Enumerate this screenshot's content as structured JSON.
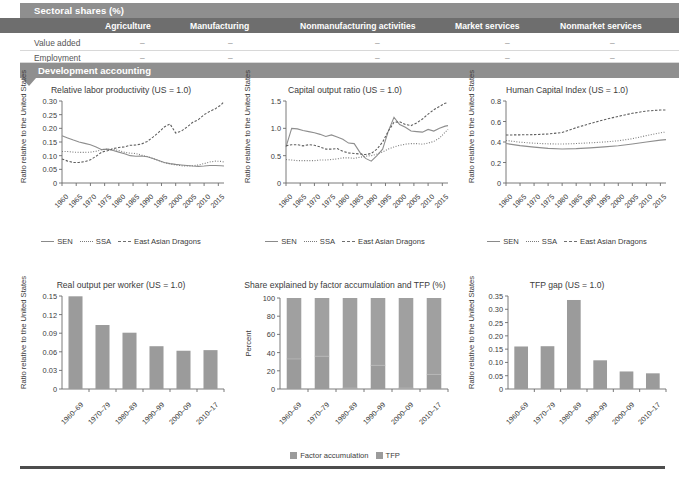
{
  "table": {
    "section_title": "Sectoral shares (%)",
    "columns": [
      "Agriculture",
      "Manufacturing",
      "Nonmanufacturing activities",
      "Market services",
      "Nonmarket services"
    ],
    "rows": [
      {
        "label": "Value added",
        "values": [
          "–",
          "–",
          "–",
          "–",
          "–"
        ]
      },
      {
        "label": "Employment",
        "values": [
          "–",
          "–",
          "–",
          "–",
          "–"
        ]
      }
    ],
    "dev_title": "Development accounting"
  },
  "line_legend": [
    {
      "name": "SEN",
      "style": "solid"
    },
    {
      "name": "SSA",
      "style": "dotted"
    },
    {
      "name": "East Asian Dragons",
      "style": "dashed"
    }
  ],
  "bar_legend": [
    {
      "name": "Factor accumulation",
      "color": "#9b9b9b"
    },
    {
      "name": "TFP",
      "color": "#9b9b9b"
    }
  ],
  "chart_data": [
    {
      "id": "relative-labor-productivity",
      "type": "line",
      "title": "Relative labor productivity (US = 1.0)",
      "xlabel": "",
      "ylabel": "Ratio relative to the United States",
      "ylim": [
        0,
        0.3
      ],
      "yticks": [
        0,
        0.05,
        0.1,
        0.15,
        0.2,
        0.25,
        0.3
      ],
      "ytick_labels": [
        "0",
        "0.05",
        "0.10",
        "0.15",
        "0.20",
        "0.25",
        "0.30"
      ],
      "xlim": [
        1960,
        2017
      ],
      "xticks": [
        1960,
        1965,
        1970,
        1975,
        1980,
        1985,
        1990,
        1995,
        2000,
        2005,
        2010,
        2015
      ],
      "xtick_labels": [
        "1960",
        "1965",
        "1970",
        "1975",
        "1980",
        "1985",
        "1990",
        "1995",
        "2000",
        "2005",
        "2010",
        "2015"
      ],
      "grid": false,
      "legend_position": "bottom",
      "series": [
        {
          "name": "SEN",
          "style": "solid",
          "x": [
            1960,
            1962,
            1964,
            1966,
            1968,
            1970,
            1972,
            1974,
            1976,
            1978,
            1980,
            1982,
            1984,
            1986,
            1988,
            1990,
            1992,
            1994,
            1996,
            1998,
            2000,
            2002,
            2004,
            2006,
            2008,
            2010,
            2012,
            2014,
            2016,
            2017
          ],
          "values": [
            0.173,
            0.165,
            0.157,
            0.15,
            0.145,
            0.14,
            0.132,
            0.122,
            0.124,
            0.119,
            0.113,
            0.107,
            0.1,
            0.098,
            0.099,
            0.096,
            0.09,
            0.082,
            0.075,
            0.071,
            0.068,
            0.066,
            0.064,
            0.062,
            0.061,
            0.062,
            0.064,
            0.064,
            0.063,
            0.062
          ]
        },
        {
          "name": "SSA",
          "style": "dotted",
          "x": [
            1960,
            1962,
            1964,
            1966,
            1968,
            1970,
            1972,
            1974,
            1976,
            1978,
            1980,
            1982,
            1984,
            1986,
            1988,
            1990,
            1992,
            1994,
            1996,
            1998,
            2000,
            2002,
            2004,
            2006,
            2008,
            2010,
            2012,
            2014,
            2016,
            2017
          ],
          "values": [
            0.115,
            0.115,
            0.113,
            0.112,
            0.112,
            0.113,
            0.116,
            0.122,
            0.124,
            0.123,
            0.119,
            0.112,
            0.109,
            0.108,
            0.102,
            0.097,
            0.09,
            0.082,
            0.074,
            0.07,
            0.066,
            0.063,
            0.062,
            0.063,
            0.066,
            0.071,
            0.077,
            0.08,
            0.079,
            0.077
          ]
        },
        {
          "name": "East Asian Dragons",
          "style": "dashed",
          "x": [
            1960,
            1962,
            1964,
            1966,
            1968,
            1970,
            1972,
            1974,
            1976,
            1978,
            1980,
            1982,
            1984,
            1986,
            1988,
            1990,
            1992,
            1994,
            1996,
            1998,
            2000,
            2002,
            2004,
            2006,
            2008,
            2010,
            2012,
            2014,
            2016,
            2017
          ],
          "values": [
            0.088,
            0.08,
            0.075,
            0.075,
            0.078,
            0.085,
            0.098,
            0.113,
            0.118,
            0.126,
            0.13,
            0.132,
            0.138,
            0.139,
            0.143,
            0.152,
            0.168,
            0.185,
            0.205,
            0.216,
            0.183,
            0.19,
            0.205,
            0.222,
            0.232,
            0.25,
            0.262,
            0.272,
            0.286,
            0.298
          ]
        }
      ]
    },
    {
      "id": "capital-output-ratio",
      "type": "line",
      "title": "Capital output ratio (US = 1.0)",
      "xlabel": "",
      "ylabel": "Ratio relative to the United States",
      "ylim": [
        0,
        1.5
      ],
      "yticks": [
        0,
        0.5,
        1.0,
        1.5
      ],
      "ytick_labels": [
        "0",
        "0.5",
        "1.0",
        "1.5"
      ],
      "xlim": [
        1960,
        2017
      ],
      "xticks": [
        1960,
        1965,
        1970,
        1975,
        1980,
        1985,
        1990,
        1995,
        2000,
        2005,
        2010,
        2015
      ],
      "xtick_labels": [
        "1960",
        "1965",
        "1970",
        "1975",
        "1980",
        "1985",
        "1990",
        "1995",
        "2000",
        "2005",
        "2010",
        "2015"
      ],
      "grid": false,
      "legend_position": "bottom",
      "series": [
        {
          "name": "SEN",
          "style": "solid",
          "x": [
            1960,
            1962,
            1964,
            1966,
            1968,
            1970,
            1972,
            1974,
            1976,
            1978,
            1980,
            1982,
            1984,
            1986,
            1988,
            1990,
            1992,
            1994,
            1996,
            1998,
            2000,
            2002,
            2004,
            2006,
            2008,
            2010,
            2012,
            2014,
            2016,
            2017
          ],
          "values": [
            0.66,
            1.0,
            0.99,
            0.96,
            0.94,
            0.92,
            0.89,
            0.85,
            0.88,
            0.84,
            0.8,
            0.73,
            0.72,
            0.56,
            0.45,
            0.4,
            0.5,
            0.62,
            0.95,
            1.2,
            1.07,
            1.02,
            0.95,
            0.94,
            0.93,
            0.98,
            0.95,
            1.0,
            1.04,
            1.05
          ]
        },
        {
          "name": "SSA",
          "style": "dotted",
          "x": [
            1960,
            1962,
            1964,
            1966,
            1968,
            1970,
            1972,
            1974,
            1976,
            1978,
            1980,
            1982,
            1984,
            1986,
            1988,
            1990,
            1992,
            1994,
            1996,
            1998,
            2000,
            2002,
            2004,
            2006,
            2008,
            2010,
            2012,
            2014,
            2016,
            2017
          ],
          "values": [
            0.43,
            0.42,
            0.41,
            0.41,
            0.41,
            0.41,
            0.42,
            0.42,
            0.43,
            0.44,
            0.46,
            0.46,
            0.45,
            0.47,
            0.49,
            0.5,
            0.53,
            0.57,
            0.62,
            0.66,
            0.69,
            0.71,
            0.72,
            0.72,
            0.71,
            0.73,
            0.76,
            0.82,
            0.93,
            0.98
          ]
        },
        {
          "name": "East Asian Dragons",
          "style": "dashed",
          "x": [
            1960,
            1962,
            1964,
            1966,
            1968,
            1970,
            1972,
            1974,
            1976,
            1978,
            1980,
            1982,
            1984,
            1986,
            1988,
            1990,
            1992,
            1994,
            1996,
            1998,
            2000,
            2002,
            2004,
            2006,
            2008,
            2010,
            2012,
            2014,
            2016,
            2017
          ],
          "values": [
            0.68,
            0.7,
            0.7,
            0.68,
            0.7,
            0.69,
            0.66,
            0.62,
            0.62,
            0.63,
            0.58,
            0.55,
            0.54,
            0.53,
            0.52,
            0.54,
            0.62,
            0.75,
            0.95,
            1.11,
            1.12,
            1.07,
            1.05,
            1.1,
            1.17,
            1.26,
            1.34,
            1.4,
            1.46,
            1.47
          ]
        }
      ]
    },
    {
      "id": "human-capital-index",
      "type": "line",
      "title": "Human Capital Index (US = 1.0)",
      "xlabel": "",
      "ylabel": "Ratio relative to the United States",
      "ylim": [
        0,
        0.8
      ],
      "yticks": [
        0,
        0.2,
        0.4,
        0.6,
        0.8
      ],
      "ytick_labels": [
        "0",
        "0.2",
        "0.4",
        "0.6",
        "0.8"
      ],
      "xlim": [
        1960,
        2017
      ],
      "xticks": [
        1960,
        1965,
        1970,
        1975,
        1980,
        1985,
        1990,
        1995,
        2000,
        2005,
        2010,
        2015
      ],
      "xtick_labels": [
        "1960",
        "1965",
        "1970",
        "1975",
        "1980",
        "1985",
        "1990",
        "1995",
        "2000",
        "2005",
        "2010",
        "2015"
      ],
      "grid": false,
      "legend_position": "bottom",
      "series": [
        {
          "name": "SEN",
          "style": "solid",
          "x": [
            1960,
            1965,
            1970,
            1975,
            1980,
            1985,
            1990,
            1995,
            2000,
            2005,
            2010,
            2015,
            2017
          ],
          "values": [
            0.385,
            0.365,
            0.35,
            0.338,
            0.332,
            0.335,
            0.343,
            0.352,
            0.363,
            0.38,
            0.4,
            0.418,
            0.423
          ]
        },
        {
          "name": "SSA",
          "style": "dotted",
          "x": [
            1960,
            1965,
            1970,
            1975,
            1980,
            1985,
            1990,
            1995,
            2000,
            2005,
            2010,
            2015,
            2017
          ],
          "values": [
            0.415,
            0.398,
            0.388,
            0.382,
            0.38,
            0.385,
            0.392,
            0.4,
            0.412,
            0.432,
            0.462,
            0.49,
            0.498
          ]
        },
        {
          "name": "East Asian Dragons",
          "style": "dashed",
          "x": [
            1960,
            1965,
            1970,
            1975,
            1980,
            1985,
            1990,
            1995,
            2000,
            2005,
            2010,
            2015,
            2017
          ],
          "values": [
            0.468,
            0.47,
            0.472,
            0.478,
            0.492,
            0.54,
            0.58,
            0.618,
            0.65,
            0.68,
            0.702,
            0.712,
            0.713
          ]
        }
      ]
    },
    {
      "id": "real-output-per-worker",
      "type": "bar",
      "title": "Real output per worker (US = 1.0)",
      "xlabel": "",
      "ylabel": "Ratio relative to the United States",
      "ylim": [
        0,
        0.15
      ],
      "yticks": [
        0,
        0.03,
        0.06,
        0.09,
        0.12,
        0.15
      ],
      "ytick_labels": [
        "0",
        "0.03",
        "0.06",
        "0.09",
        "0.12",
        "0.15"
      ],
      "categories": [
        "1960–69",
        "1970–79",
        "1980–89",
        "1990–99",
        "2000–09",
        "2010–17"
      ],
      "values": [
        0.1495,
        0.1032,
        0.0908,
        0.069,
        0.0617,
        0.0627
      ],
      "grid": false,
      "legend_position": "none"
    },
    {
      "id": "share-factor-accumulation-tfp",
      "type": "bar",
      "title": "Share explained by factor accumulation and TFP (%)",
      "xlabel": "",
      "ylabel": "Percent",
      "ylim": [
        0,
        100
      ],
      "yticks": [
        0,
        20,
        40,
        60,
        80,
        100
      ],
      "ytick_labels": [
        "0",
        "20",
        "40",
        "60",
        "80",
        "100"
      ],
      "categories": [
        "1960–69",
        "1970–79",
        "1980–89",
        "1990–99",
        "2000–09",
        "2010–17"
      ],
      "stacked": true,
      "series": [
        {
          "name": "Factor accumulation",
          "values": [
            33,
            36,
            1,
            26,
            1,
            16
          ]
        },
        {
          "name": "TFP",
          "values": [
            67,
            64,
            99,
            74,
            99,
            84
          ]
        }
      ],
      "grid": false,
      "legend_position": "bottom"
    },
    {
      "id": "tfp-gap",
      "type": "bar",
      "title": "TFP gap (US = 1.0)",
      "xlabel": "",
      "ylabel": "Ratio relative to the United States",
      "ylim": [
        0,
        0.35
      ],
      "yticks": [
        0,
        0.05,
        0.1,
        0.15,
        0.2,
        0.25,
        0.3,
        0.35
      ],
      "ytick_labels": [
        "0",
        "0.05",
        "0.10",
        "0.15",
        "0.20",
        "0.25",
        "0.30",
        "0.35"
      ],
      "categories": [
        "1960–69",
        "1970–79",
        "1980–89",
        "1990–99",
        "2000–09",
        "2010–17"
      ],
      "values": [
        0.16,
        0.161,
        0.335,
        0.108,
        0.066,
        0.059
      ],
      "grid": false,
      "legend_position": "none"
    }
  ]
}
